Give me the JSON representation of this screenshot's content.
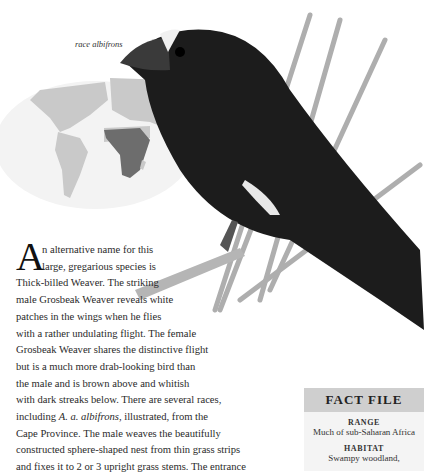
{
  "illustration": {
    "caption": "race albifrons",
    "subject": "Grosbeak Weaver (male)",
    "map_highlight_region": "sub-Saharan Africa"
  },
  "article": {
    "drop_cap": "A",
    "lines": [
      "n alternative name for this",
      "large, gregarious species is",
      "Thick-billed Weaver. The striking",
      "male Grosbeak Weaver reveals white",
      "patches in the wings when he flies",
      "with a rather undulating flight. The female",
      "Grosbeak Weaver shares the distinctive flight",
      "but is a much more drab-looking bird than",
      "the male and is brown above and whitish",
      "with dark streaks below. There are several races,",
      "including ",
      "Cape Province. The male weaves the beautifully",
      "constructed sphere-shaped nest from thin grass strips",
      "and fixes it to 2 or 3 upright grass stems. The entrance"
    ],
    "italic_species": "A. a. albifrons",
    "line11_rest": ", illustrated, from the"
  },
  "fact_file": {
    "title": "FACT FILE",
    "sections": [
      {
        "label": "RANGE",
        "value": "Much of sub-Saharan Africa"
      },
      {
        "label": "HABITAT",
        "value": "Swampy woodland,"
      }
    ]
  },
  "colors": {
    "map_land": "#c9c9c9",
    "map_highlight": "#6d6d6d",
    "bird_body": "#1c1c1c",
    "fact_header_bg": "#cfcfcf",
    "fact_body_bg": "#f4f4f4"
  }
}
